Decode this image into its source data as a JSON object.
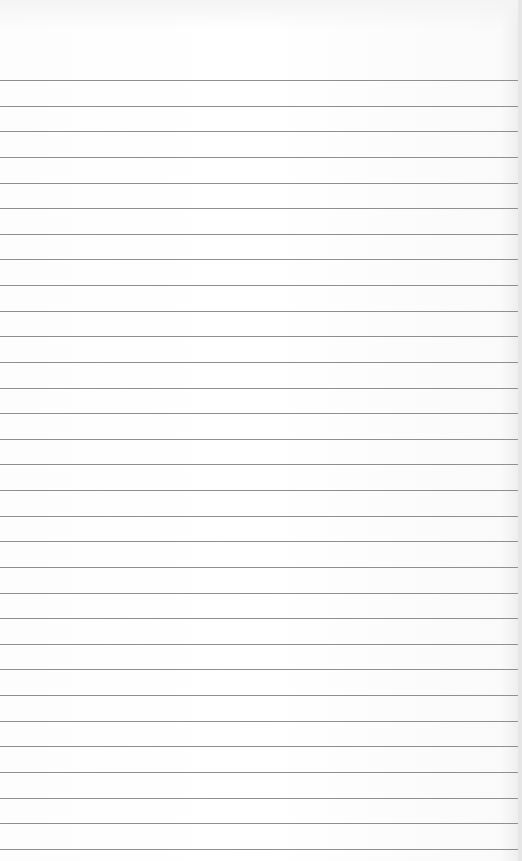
{
  "paper": {
    "type": "lined-paper",
    "background_color": "#ffffff",
    "line_color": "#8f8f8f",
    "first_line_y": 80,
    "line_spacing": 25.63,
    "line_count": 31,
    "text_content": ""
  }
}
